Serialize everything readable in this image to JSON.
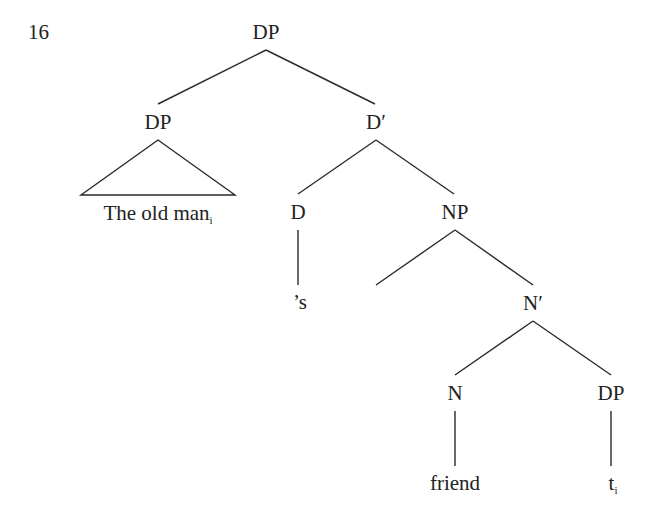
{
  "example_number": "16",
  "tree": {
    "root": {
      "label": "DP"
    },
    "spec_dp": {
      "label": "DP",
      "terminal": "The old man",
      "terminal_index": "i"
    },
    "d_bar": {
      "label": "D′"
    },
    "d_head": {
      "label": "D",
      "terminal": "’s"
    },
    "np": {
      "label": "NP"
    },
    "n_bar": {
      "label": "N′"
    },
    "n_head": {
      "label": "N",
      "terminal": "friend"
    },
    "complement_dp": {
      "label": "DP",
      "terminal": "t",
      "terminal_index": "i"
    }
  },
  "colors": {
    "ink": "#222222",
    "background": "#ffffff"
  }
}
